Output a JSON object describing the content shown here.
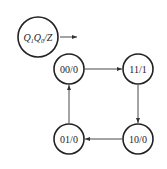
{
  "diagram": {
    "type": "state-diagram",
    "legend": {
      "label_parts": [
        {
          "text": "Q",
          "sub": "1"
        },
        {
          "text": "Q",
          "sub": "0"
        },
        {
          "text": "/Z",
          "sub": ""
        }
      ],
      "label": "Q1Q0/Z"
    },
    "states": [
      {
        "id": "s00",
        "label": "00/0"
      },
      {
        "id": "s11",
        "label": "11/1"
      },
      {
        "id": "s10",
        "label": "10/0"
      },
      {
        "id": "s01",
        "label": "01/0"
      }
    ],
    "transitions": [
      {
        "from": "00/0",
        "to": "11/1"
      },
      {
        "from": "11/1",
        "to": "10/0"
      },
      {
        "from": "10/0",
        "to": "01/0"
      },
      {
        "from": "01/0",
        "to": "00/0"
      }
    ],
    "colors": {
      "stroke": "#222222",
      "background": "#ffffff"
    }
  }
}
